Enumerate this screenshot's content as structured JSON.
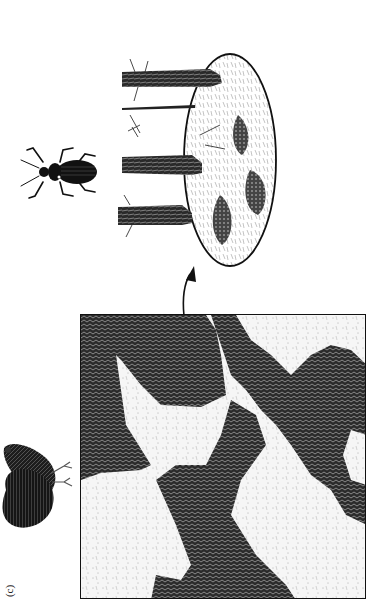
{
  "figure": {
    "panel_label": "(c)",
    "caption_fragment": "Landscape fragmentation effects on various forms of organisms: a bird illustrates coarse-grained and a beetle fine-grained perception of habitat",
    "illustrations": {
      "large_organism": "grouse-bird",
      "small_organism": "ground-beetle",
      "map": "patchy-landscape-map",
      "inset": "forest-floor-detail"
    },
    "colors": {
      "ink": "#111111",
      "dark_patch": "#2b2b2b",
      "light_patch": "#f5f5f5",
      "background": "#ffffff"
    }
  }
}
